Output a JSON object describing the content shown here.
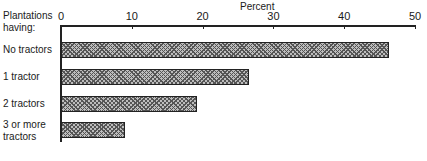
{
  "chart_data": {
    "type": "bar",
    "orientation": "horizontal",
    "title": "",
    "xlabel": "Percent",
    "ylabel": "Plantations having:",
    "categories": [
      "No tractors",
      "1 tractor",
      "2 tractors",
      "3 or more tractors"
    ],
    "values": [
      46.3,
      26.5,
      19.2,
      9.0
    ],
    "xlim": [
      0,
      50
    ],
    "xticks": [
      "0",
      "10",
      "20",
      "30",
      "40",
      "50"
    ],
    "grid": false,
    "legend": null,
    "bar_fill": "crosshatch"
  },
  "labels": {
    "axis_title": "Percent",
    "row_header": "Plantations\nhaving:",
    "rows": [
      "No tractors",
      "1 tractor",
      "2 tractors",
      "3 or more\ntractors"
    ]
  }
}
